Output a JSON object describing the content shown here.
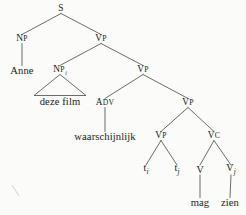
{
  "figure": {
    "type": "syntax-tree",
    "language": "Dutch",
    "sentence": "Anne deze film waarschijnlijk mag zien",
    "background_color": "#fbfbfa",
    "line_color": "#555150",
    "text_color": "#201c1b"
  },
  "nodes": [
    {
      "id": "s",
      "label": "S",
      "sub": "",
      "kind": "category",
      "x": 61,
      "y": 9
    },
    {
      "id": "np1",
      "label": "NP",
      "sub": "",
      "kind": "category",
      "x": 22,
      "y": 39
    },
    {
      "id": "vp1",
      "label": "VP",
      "sub": "",
      "kind": "category",
      "x": 101,
      "y": 39
    },
    {
      "id": "anne",
      "label": "Anne",
      "sub": "",
      "kind": "terminal",
      "x": 22,
      "y": 71
    },
    {
      "id": "np2",
      "label": "NP",
      "sub": "i",
      "kind": "category",
      "x": 60,
      "y": 70
    },
    {
      "id": "vp2",
      "label": "VP",
      "sub": "",
      "kind": "category",
      "x": 143,
      "y": 70
    },
    {
      "id": "dezefilm",
      "label": "deze film",
      "sub": "",
      "kind": "terminal",
      "x": 60,
      "y": 102
    },
    {
      "id": "adv",
      "label": "ADV",
      "sub": "",
      "kind": "category",
      "x": 105,
      "y": 103
    },
    {
      "id": "vp3",
      "label": "VP",
      "sub": "",
      "kind": "category",
      "x": 188,
      "y": 103
    },
    {
      "id": "waar",
      "label": "waarschijnlijk",
      "sub": "",
      "kind": "terminal",
      "x": 105,
      "y": 137
    },
    {
      "id": "vp4",
      "label": "VP",
      "sub": "",
      "kind": "category",
      "x": 161,
      "y": 136
    },
    {
      "id": "vc",
      "label": "VC",
      "sub": "",
      "kind": "category",
      "x": 214,
      "y": 136
    },
    {
      "id": "ti",
      "label": "t",
      "sub": "i",
      "kind": "trace",
      "x": 146,
      "y": 170
    },
    {
      "id": "tj",
      "label": "t",
      "sub": "j",
      "kind": "trace",
      "x": 177,
      "y": 170
    },
    {
      "id": "v1",
      "label": "V",
      "sub": "",
      "kind": "trace",
      "x": 200,
      "y": 170
    },
    {
      "id": "vj",
      "label": "V",
      "sub": "j",
      "kind": "trace",
      "x": 231,
      "y": 170
    },
    {
      "id": "mag",
      "label": "mag",
      "sub": "",
      "kind": "terminal",
      "x": 200,
      "y": 203
    },
    {
      "id": "zien",
      "label": "zien",
      "sub": "",
      "kind": "terminal",
      "x": 230,
      "y": 203
    }
  ],
  "edges": [
    {
      "from": "s",
      "to": "np1"
    },
    {
      "from": "s",
      "to": "vp1"
    },
    {
      "from": "np1",
      "to": "anne"
    },
    {
      "from": "vp1",
      "to": "np2"
    },
    {
      "from": "vp1",
      "to": "vp2"
    },
    {
      "from": "vp2",
      "to": "adv"
    },
    {
      "from": "vp2",
      "to": "vp3"
    },
    {
      "from": "adv",
      "to": "waar"
    },
    {
      "from": "vp3",
      "to": "vp4"
    },
    {
      "from": "vp3",
      "to": "vc"
    },
    {
      "from": "vp4",
      "to": "ti"
    },
    {
      "from": "vp4",
      "to": "tj"
    },
    {
      "from": "vc",
      "to": "v1"
    },
    {
      "from": "vc",
      "to": "vj"
    },
    {
      "from": "v1",
      "to": "mag"
    },
    {
      "from": "vj",
      "to": "zien"
    }
  ],
  "triangles": [
    {
      "from": "np2",
      "to": "dezefilm",
      "half_width": 26
    }
  ]
}
